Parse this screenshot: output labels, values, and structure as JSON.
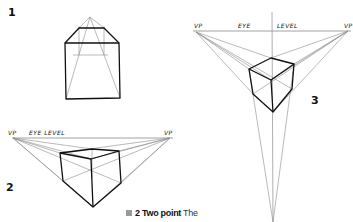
{
  "figure": {
    "labels": {
      "one": "1",
      "two": "2",
      "three": "3"
    },
    "drawing_2": {
      "left_vp_label": "VP",
      "eye_level_label": "EYE LEVEL",
      "right_vp_label": "VP"
    },
    "drawing_3": {
      "left_vp_label": "VP",
      "eye_label": "EYE",
      "level_label": "LEVEL",
      "right_vp_label": "VP"
    },
    "caption": {
      "number": "2",
      "title": "Two point",
      "text": "The"
    },
    "colors": {
      "ink": "#111111",
      "guide": "#8c8c8c",
      "background": "#ffffff"
    }
  }
}
